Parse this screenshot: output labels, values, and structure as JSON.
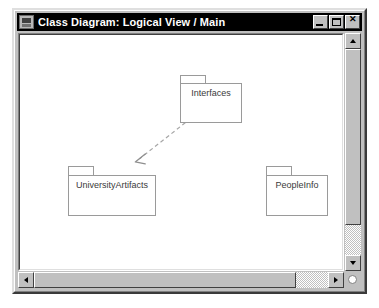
{
  "window": {
    "title": "Class Diagram: Logical View / Main",
    "icon": "diagram-document-icon",
    "buttons": {
      "minimize": "_",
      "maximize": "□",
      "close": "✕"
    }
  },
  "diagram": {
    "type": "uml-class-diagram",
    "background": "#ffffff",
    "node_border_color": "#9a9a9a",
    "label_color": "#3a3a3a",
    "packages": [
      {
        "id": "interfaces",
        "label": "Interfaces",
        "x": 160,
        "y": 40,
        "width": 62,
        "height": 40,
        "tab_width": 26,
        "tab_height": 8
      },
      {
        "id": "university-artifacts",
        "label": "UniversityArtifacts",
        "x": 48,
        "y": 131,
        "width": 88,
        "height": 41,
        "tab_width": 26,
        "tab_height": 9
      },
      {
        "id": "people-info",
        "label": "PeopleInfo",
        "x": 246,
        "y": 131,
        "width": 62,
        "height": 41,
        "tab_width": 26,
        "tab_height": 9
      }
    ],
    "relationships": [
      {
        "id": "interfaces-to-universityartifacts",
        "kind": "dependency",
        "style": "dashed",
        "arrowhead": "open",
        "from": "interfaces",
        "to": "university-artifacts",
        "x1": 172,
        "y1": 84,
        "x2": 116,
        "y2": 128,
        "color": "#9a9a9a"
      }
    ]
  },
  "scrollbars": {
    "vertical": {
      "up_arrow": "scroll-up-arrow-icon",
      "down_arrow": "scroll-down-arrow-icon",
      "thumb_top": 16,
      "thumb_height": 176
    },
    "horizontal": {
      "left_arrow": "scroll-left-arrow-icon",
      "right_arrow": "scroll-right-arrow-icon",
      "thumb_left": 16,
      "thumb_width": 262
    },
    "size_grip": "resize-grip"
  }
}
